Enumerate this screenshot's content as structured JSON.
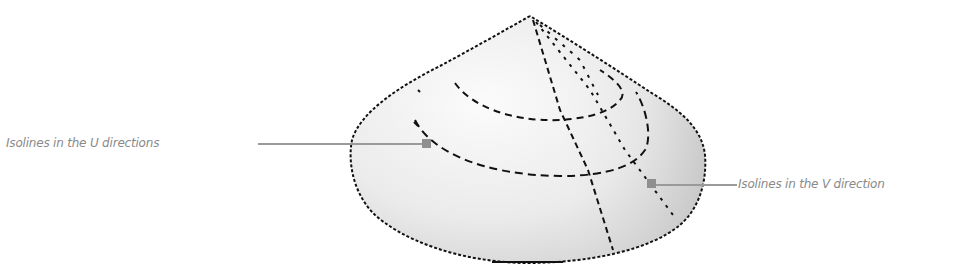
{
  "figure": {
    "labels": {
      "u_direction": "Isolines in the U directions",
      "v_direction": "Isolines in the V direction"
    },
    "colors": {
      "background": "#ffffff",
      "surface_light": "#f4f4f4",
      "surface_dark": "#c8c8c8",
      "isoline": "#111111",
      "leader": "#9a9a9a",
      "marker": "#8f8f8f",
      "label_text": "#8a8a8a"
    }
  }
}
